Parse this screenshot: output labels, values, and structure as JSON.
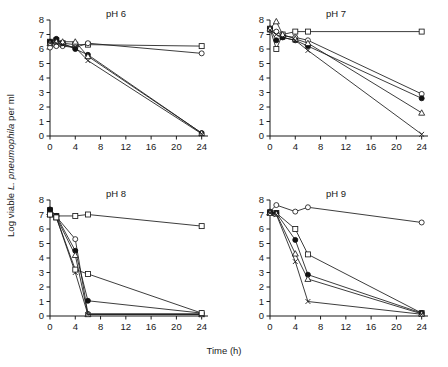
{
  "figure": {
    "xlabel": "Time (h)",
    "ylabel_prefix": "Log viable ",
    "ylabel_italic": "L. pneumophila",
    "ylabel_suffix": " per ml"
  },
  "chart_data": [
    {
      "type": "line",
      "title": "pH 6",
      "xlabel": "Time (h)",
      "ylabel": "Log viable L. pneumophila per ml",
      "xlim": [
        0,
        25
      ],
      "ylim": [
        0,
        8
      ],
      "xticks": [
        0,
        4,
        8,
        12,
        16,
        20,
        24
      ],
      "yticks": [
        0,
        1,
        2,
        3,
        4,
        5,
        6,
        7,
        8
      ],
      "grid": false,
      "legend": "none",
      "x": [
        0,
        1,
        2,
        4,
        6,
        24
      ],
      "series": [
        {
          "name": "open-square",
          "marker": "open-square",
          "values": [
            6.5,
            6.6,
            6.4,
            6.3,
            6.3,
            6.2
          ]
        },
        {
          "name": "open-circle",
          "marker": "open-circle",
          "values": [
            6.1,
            6.2,
            6.2,
            6.1,
            6.4,
            5.7
          ]
        },
        {
          "name": "filled-circle",
          "marker": "filled-circle",
          "values": [
            6.5,
            6.7,
            6.4,
            6.0,
            5.6,
            0.2
          ]
        },
        {
          "name": "open-triangle",
          "marker": "open-triangle",
          "values": [
            6.4,
            6.5,
            6.5,
            6.5,
            5.5,
            0.2
          ]
        },
        {
          "name": "cross",
          "marker": "cross",
          "values": [
            6.4,
            6.4,
            6.3,
            6.1,
            5.2,
            0.15
          ]
        }
      ]
    },
    {
      "type": "line",
      "title": "pH 7",
      "xlabel": "Time (h)",
      "ylabel": "Log viable L. pneumophila per ml",
      "xlim": [
        0,
        25
      ],
      "ylim": [
        0,
        8
      ],
      "xticks": [
        0,
        4,
        8,
        12,
        16,
        20,
        24
      ],
      "yticks": [
        0,
        1,
        2,
        3,
        4,
        5,
        6,
        7,
        8
      ],
      "grid": false,
      "legend": "none",
      "x": [
        0,
        1,
        2,
        4,
        6,
        24
      ],
      "series": [
        {
          "name": "open-square",
          "marker": "open-square",
          "values": [
            7.4,
            6.0,
            7.0,
            7.2,
            7.2,
            7.2
          ]
        },
        {
          "name": "open-circle",
          "marker": "open-circle",
          "values": [
            7.3,
            7.2,
            6.9,
            6.8,
            6.6,
            2.9
          ]
        },
        {
          "name": "filled-circle",
          "marker": "filled-circle",
          "values": [
            7.4,
            6.6,
            6.8,
            6.6,
            6.2,
            2.6
          ]
        },
        {
          "name": "open-triangle",
          "marker": "open-triangle",
          "values": [
            7.4,
            7.9,
            7.0,
            6.7,
            6.4,
            1.6
          ]
        },
        {
          "name": "cross",
          "marker": "cross",
          "values": [
            7.3,
            7.0,
            6.8,
            6.6,
            5.9,
            0.12
          ]
        }
      ]
    },
    {
      "type": "line",
      "title": "pH 8",
      "xlabel": "Time (h)",
      "ylabel": "Log viable L. pneumophila per ml",
      "xlim": [
        0,
        25
      ],
      "ylim": [
        0,
        8
      ],
      "xticks": [
        0,
        4,
        8,
        12,
        16,
        20,
        24
      ],
      "yticks": [
        0,
        1,
        2,
        3,
        4,
        5,
        6,
        7,
        8
      ],
      "grid": false,
      "legend": "none",
      "x": [
        0,
        1,
        4,
        6,
        24
      ],
      "series": [
        {
          "name": "open-square-flat",
          "marker": "open-square",
          "values": [
            7.3,
            6.9,
            6.9,
            7.0,
            6.2
          ]
        },
        {
          "name": "open-circle",
          "marker": "open-circle",
          "values": [
            7.0,
            6.85,
            5.3,
            0.15,
            0.15
          ]
        },
        {
          "name": "filled-circle",
          "marker": "filled-circle",
          "values": [
            7.35,
            6.9,
            4.5,
            1.05,
            0.2
          ]
        },
        {
          "name": "open-triangle",
          "marker": "open-triangle",
          "values": [
            7.0,
            6.8,
            4.2,
            0.12,
            0.12
          ]
        },
        {
          "name": "cross",
          "marker": "cross",
          "values": [
            7.0,
            6.8,
            3.0,
            0.1,
            0.1
          ]
        },
        {
          "name": "open-square-decline",
          "marker": "open-square",
          "values": [
            7.0,
            6.8,
            3.2,
            2.9,
            0.2
          ]
        }
      ]
    },
    {
      "type": "line",
      "title": "pH 9",
      "xlabel": "Time (h)",
      "ylabel": "Log viable L. pneumophila per ml",
      "xlim": [
        0,
        25
      ],
      "ylim": [
        0,
        8
      ],
      "xticks": [
        0,
        4,
        8,
        12,
        16,
        20,
        24
      ],
      "yticks": [
        0,
        1,
        2,
        3,
        4,
        5,
        6,
        7,
        8
      ],
      "grid": false,
      "legend": "none",
      "x": [
        0,
        1,
        4,
        6,
        24
      ],
      "series": [
        {
          "name": "open-circle-flat",
          "marker": "open-circle",
          "values": [
            7.2,
            7.65,
            7.2,
            7.5,
            6.45
          ]
        },
        {
          "name": "open-square-decline",
          "marker": "open-square",
          "values": [
            7.15,
            7.1,
            6.0,
            4.25,
            0.2
          ]
        },
        {
          "name": "filled-circle",
          "marker": "filled-circle",
          "values": [
            7.15,
            7.1,
            5.25,
            2.85,
            0.2
          ]
        },
        {
          "name": "open-triangle",
          "marker": "open-triangle",
          "values": [
            7.1,
            7.05,
            4.3,
            2.55,
            0.15
          ]
        },
        {
          "name": "cross",
          "marker": "cross",
          "values": [
            7.1,
            7.0,
            3.75,
            1.0,
            0.12
          ]
        }
      ]
    }
  ]
}
